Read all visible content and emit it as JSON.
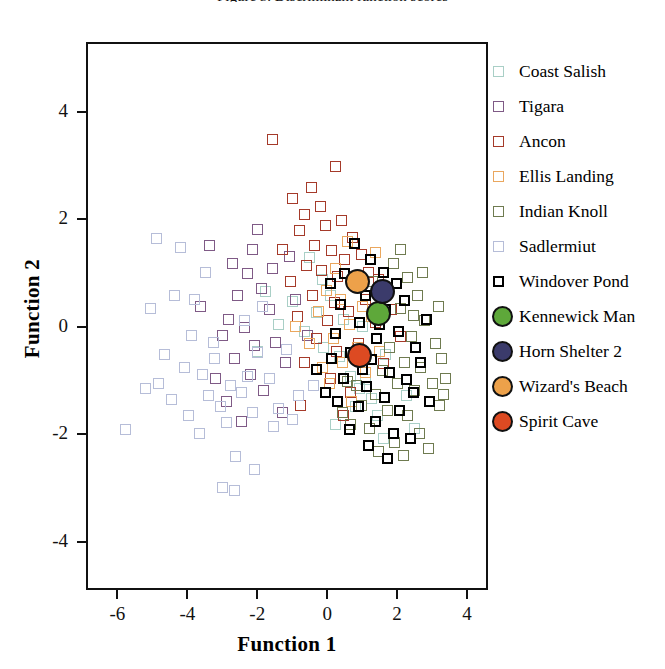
{
  "figure": {
    "clipped_title": "Figure 5. Discriminant function scores"
  },
  "chart_data": {
    "type": "scatter",
    "title": "",
    "xlabel": "Function 1",
    "ylabel": "Function 2",
    "xlim": [
      -6.9,
      4.6
    ],
    "ylim": [
      -4.9,
      5.3
    ],
    "xticks": [
      -6,
      -4,
      -2,
      0,
      2,
      4
    ],
    "yticks": [
      -4,
      -2,
      0,
      2,
      4
    ],
    "xticklabels": [
      "-6",
      "-4",
      "-2",
      "0",
      "2",
      "4"
    ],
    "yticklabels": [
      "-4",
      "-2",
      "0",
      "2",
      "4"
    ],
    "grid": false,
    "legend_position": "right",
    "series": [
      {
        "name": "Coast Salish",
        "marker": "square",
        "color": "#a9cfc6",
        "points": [
          [
            -0.55,
            1.32
          ],
          [
            -0.2,
            0.92
          ],
          [
            -1.05,
            0.5
          ],
          [
            -0.35,
            0.3
          ],
          [
            -0.7,
            -0.05
          ],
          [
            0.05,
            0.62
          ],
          [
            0.42,
            0.18
          ],
          [
            -0.15,
            -0.35
          ],
          [
            0.3,
            -0.52
          ],
          [
            0.62,
            -0.88
          ],
          [
            0.88,
            -1.12
          ],
          [
            1.05,
            -0.95
          ],
          [
            1.2,
            -1.3
          ],
          [
            0.75,
            -1.45
          ],
          [
            1.38,
            -1.62
          ],
          [
            -1.45,
            0.08
          ],
          [
            -2.05,
            -0.42
          ],
          [
            0.18,
            -1.78
          ],
          [
            1.55,
            -2.05
          ],
          [
            2.2,
            -1.25
          ],
          [
            -1.82,
            0.7
          ],
          [
            0.95,
            0.05
          ],
          [
            1.62,
            -0.48
          ],
          [
            2.45,
            -1.85
          ]
        ]
      },
      {
        "name": "Tigara",
        "marker": "square",
        "color": "#7f5a86",
        "points": [
          [
            -2.35,
            1.02
          ],
          [
            -2.62,
            0.62
          ],
          [
            -1.95,
            0.75
          ],
          [
            -2.88,
            0.18
          ],
          [
            -2.42,
            0.02
          ],
          [
            -1.72,
            0.35
          ],
          [
            -2.15,
            -0.32
          ],
          [
            -2.7,
            -0.55
          ],
          [
            -3.05,
            -0.12
          ],
          [
            -1.55,
            -0.25
          ],
          [
            -2.25,
            -0.85
          ],
          [
            -1.88,
            -1.15
          ],
          [
            -2.95,
            -1.35
          ],
          [
            -3.42,
            1.55
          ],
          [
            -2.18,
            1.48
          ],
          [
            -1.62,
            1.12
          ],
          [
            -2.52,
            -1.72
          ],
          [
            -1.25,
            -0.62
          ],
          [
            -3.25,
            -0.92
          ],
          [
            -1.15,
            1.35
          ],
          [
            -0.95,
            0.55
          ],
          [
            -1.35,
            -1.55
          ],
          [
            -2.05,
            1.85
          ],
          [
            -0.62,
            -0.12
          ],
          [
            -3.68,
            0.42
          ],
          [
            -2.78,
            1.22
          ]
        ]
      },
      {
        "name": "Ancon",
        "marker": "square",
        "color": "#a53a2a",
        "points": [
          [
            -1.62,
            3.52
          ],
          [
            -0.52,
            2.62
          ],
          [
            -0.25,
            2.28
          ],
          [
            -0.72,
            2.12
          ],
          [
            -0.12,
            1.92
          ],
          [
            0.35,
            2.02
          ],
          [
            0.68,
            1.7
          ],
          [
            -0.42,
            1.55
          ],
          [
            -0.85,
            1.82
          ],
          [
            0.08,
            1.45
          ],
          [
            0.45,
            1.28
          ],
          [
            0.92,
            1.38
          ],
          [
            -0.65,
            1.18
          ],
          [
            -0.22,
            1.08
          ],
          [
            0.25,
            0.98
          ],
          [
            0.72,
            0.82
          ],
          [
            1.12,
            1.05
          ],
          [
            -1.12,
            0.88
          ],
          [
            -0.48,
            0.62
          ],
          [
            0.15,
            0.48
          ],
          [
            0.55,
            0.32
          ],
          [
            1.05,
            0.55
          ],
          [
            1.42,
            0.92
          ],
          [
            -0.92,
            0.22
          ],
          [
            -0.35,
            -0.18
          ],
          [
            0.22,
            -0.42
          ],
          [
            0.85,
            -0.28
          ],
          [
            1.32,
            0.12
          ],
          [
            -0.72,
            -0.62
          ],
          [
            0.05,
            -0.92
          ],
          [
            0.62,
            -1.18
          ],
          [
            1.55,
            -0.65
          ],
          [
            -1.35,
            1.48
          ],
          [
            -1.05,
            2.42
          ],
          [
            0.18,
            3.02
          ],
          [
            -0.05,
            0.15
          ],
          [
            1.78,
            0.35
          ],
          [
            2.05,
            -0.15
          ],
          [
            -0.82,
            -1.42
          ],
          [
            0.42,
            -1.62
          ]
        ]
      },
      {
        "name": "Ellis Landing",
        "marker": "square",
        "color": "#eaa75e",
        "points": [
          [
            0.52,
            1.62
          ],
          [
            0.18,
            1.12
          ],
          [
            0.75,
            0.88
          ],
          [
            0.32,
            0.55
          ],
          [
            -0.08,
            0.72
          ],
          [
            0.95,
            0.42
          ],
          [
            0.58,
            0.08
          ],
          [
            0.12,
            -0.18
          ],
          [
            -0.32,
            0.32
          ],
          [
            0.82,
            -0.35
          ],
          [
            1.22,
            0.22
          ],
          [
            0.38,
            -0.62
          ],
          [
            -0.55,
            -0.28
          ],
          [
            0.02,
            -1.02
          ],
          [
            1.05,
            -0.82
          ],
          [
            -0.95,
            0.05
          ],
          [
            0.65,
            -1.35
          ],
          [
            1.45,
            -0.42
          ],
          [
            -0.18,
            -0.72
          ],
          [
            1.32,
            1.42
          ]
        ]
      },
      {
        "name": "Indian Knoll",
        "marker": "square",
        "color": "#6f7b50",
        "points": [
          [
            1.85,
            1.22
          ],
          [
            2.25,
            0.95
          ],
          [
            1.62,
            0.72
          ],
          [
            2.52,
            0.62
          ],
          [
            2.05,
            0.38
          ],
          [
            1.42,
            0.18
          ],
          [
            2.72,
            0.15
          ],
          [
            2.35,
            -0.15
          ],
          [
            1.72,
            -0.35
          ],
          [
            3.05,
            -0.28
          ],
          [
            2.15,
            -0.62
          ],
          [
            1.52,
            -0.78
          ],
          [
            2.62,
            -0.72
          ],
          [
            3.22,
            -0.55
          ],
          [
            1.95,
            -1.02
          ],
          [
            2.45,
            -1.15
          ],
          [
            1.32,
            -1.22
          ],
          [
            2.95,
            -1.02
          ],
          [
            1.68,
            -1.52
          ],
          [
            2.25,
            -1.62
          ],
          [
            0.92,
            -1.42
          ],
          [
            3.15,
            -1.42
          ],
          [
            1.15,
            -1.85
          ],
          [
            2.58,
            -1.95
          ],
          [
            1.88,
            -2.12
          ],
          [
            0.62,
            -1.78
          ],
          [
            2.85,
            -2.22
          ],
          [
            3.28,
            -1.22
          ],
          [
            1.42,
            -2.28
          ],
          [
            2.12,
            -2.35
          ],
          [
            0.38,
            -1.55
          ],
          [
            2.68,
            1.05
          ],
          [
            3.12,
            0.42
          ],
          [
            1.25,
            0.88
          ],
          [
            0.78,
            -1.05
          ],
          [
            2.05,
            1.48
          ],
          [
            1.05,
            -0.52
          ],
          [
            3.32,
            -0.92
          ],
          [
            0.52,
            -0.98
          ],
          [
            2.42,
            0.25
          ]
        ]
      },
      {
        "name": "Sadlermiut",
        "marker": "square",
        "color": "#b6bdd8",
        "points": [
          [
            -4.95,
            1.68
          ],
          [
            -4.25,
            1.52
          ],
          [
            -5.12,
            0.38
          ],
          [
            -4.42,
            0.62
          ],
          [
            -3.85,
            0.55
          ],
          [
            -4.72,
            -0.48
          ],
          [
            -3.95,
            -0.12
          ],
          [
            -4.15,
            -0.72
          ],
          [
            -5.25,
            -1.12
          ],
          [
            -3.62,
            -0.85
          ],
          [
            -4.52,
            -1.32
          ],
          [
            -3.28,
            -0.55
          ],
          [
            -5.82,
            -1.88
          ],
          [
            -4.02,
            -1.62
          ],
          [
            -3.45,
            -1.25
          ],
          [
            -4.88,
            -1.02
          ],
          [
            -3.12,
            -1.45
          ],
          [
            -2.82,
            -1.05
          ],
          [
            -2.52,
            -1.18
          ],
          [
            -3.72,
            -1.95
          ],
          [
            -2.95,
            -1.75
          ],
          [
            -2.35,
            -0.88
          ],
          [
            -2.68,
            -2.38
          ],
          [
            -3.05,
            -2.95
          ],
          [
            -2.72,
            -3.02
          ],
          [
            -2.18,
            -1.55
          ],
          [
            -3.32,
            -0.25
          ],
          [
            -2.05,
            -0.45
          ],
          [
            -1.72,
            -0.92
          ],
          [
            -1.45,
            -1.48
          ],
          [
            -2.42,
            0.15
          ],
          [
            -1.92,
            0.42
          ],
          [
            -1.58,
            -1.82
          ],
          [
            -1.22,
            -0.38
          ],
          [
            -0.88,
            -1.25
          ],
          [
            -2.15,
            -2.62
          ],
          [
            -1.05,
            -1.68
          ],
          [
            -0.45,
            -1.05
          ],
          [
            -3.55,
            1.05
          ]
        ]
      },
      {
        "name": "Windover Pond",
        "marker": "square-heavy",
        "color": "#000000",
        "points": [
          [
            0.72,
            1.58
          ],
          [
            1.18,
            1.28
          ],
          [
            1.55,
            1.05
          ],
          [
            0.45,
            1.02
          ],
          [
            1.92,
            0.85
          ],
          [
            1.05,
            0.62
          ],
          [
            0.32,
            0.45
          ],
          [
            1.62,
            0.35
          ],
          [
            2.15,
            0.52
          ],
          [
            0.88,
            0.12
          ],
          [
            0.18,
            -0.08
          ],
          [
            1.35,
            -0.18
          ],
          [
            1.98,
            -0.05
          ],
          [
            2.48,
            -0.35
          ],
          [
            0.62,
            -0.45
          ],
          [
            1.22,
            -0.58
          ],
          [
            0.08,
            -0.55
          ],
          [
            1.72,
            -0.82
          ],
          [
            2.22,
            -0.95
          ],
          [
            0.42,
            -0.92
          ],
          [
            1.08,
            -1.08
          ],
          [
            1.58,
            -1.28
          ],
          [
            0.85,
            -1.45
          ],
          [
            2.02,
            -1.52
          ],
          [
            0.25,
            -1.35
          ],
          [
            1.32,
            -1.72
          ],
          [
            2.42,
            -1.18
          ],
          [
            0.58,
            -1.88
          ],
          [
            1.85,
            -1.95
          ],
          [
            1.12,
            -2.18
          ],
          [
            2.62,
            -0.62
          ],
          [
            -0.12,
            -1.18
          ],
          [
            2.78,
            0.18
          ],
          [
            -0.35,
            -0.75
          ],
          [
            1.45,
            0.08
          ],
          [
            0.95,
            -0.75
          ],
          [
            2.32,
            -2.05
          ],
          [
            1.68,
            -2.42
          ],
          [
            0.05,
            0.85
          ],
          [
            2.88,
            -1.35
          ]
        ]
      },
      {
        "name": "Kennewick Man",
        "marker": "circle",
        "color": "#5ea83a",
        "points": [
          [
            1.42,
            0.28
          ]
        ]
      },
      {
        "name": "Horn Shelter 2",
        "marker": "circle",
        "color": "#3b3b6b",
        "points": [
          [
            1.52,
            0.7
          ]
        ]
      },
      {
        "name": "Wizard's Beach",
        "marker": "circle",
        "color": "#eda14a",
        "points": [
          [
            0.82,
            0.88
          ]
        ]
      },
      {
        "name": "Spirit Cave",
        "marker": "circle",
        "color": "#dd4a22",
        "points": [
          [
            0.88,
            -0.5
          ]
        ]
      }
    ]
  }
}
